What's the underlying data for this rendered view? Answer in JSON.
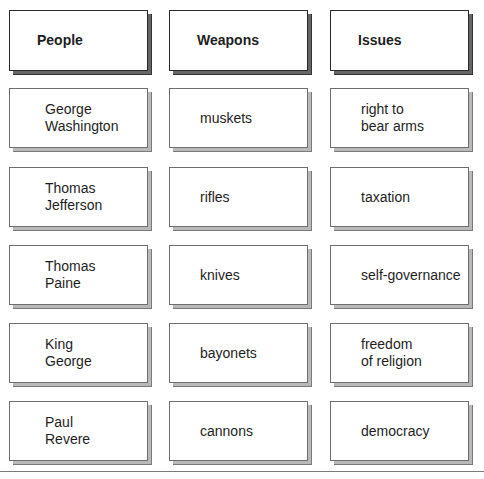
{
  "columns": [
    {
      "header": "People",
      "items": [
        "George\nWashington",
        "Thomas\nJefferson",
        "Thomas\nPaine",
        "King\nGeorge",
        "Paul\nRevere"
      ]
    },
    {
      "header": "Weapons",
      "items": [
        "muskets",
        "rifles",
        "knives",
        "bayonets",
        "cannons"
      ]
    },
    {
      "header": "Issues",
      "items": [
        "right to\nbear arms",
        "taxation",
        "self-governance",
        "freedom\nof religion",
        "democracy"
      ]
    }
  ],
  "colors": {
    "card_border": "#6e6e6e",
    "header_border": "#2a2a2a",
    "content_shadow": "#b9b9b9",
    "header_shadow": "#666666",
    "rule": "#7a7a7a"
  }
}
